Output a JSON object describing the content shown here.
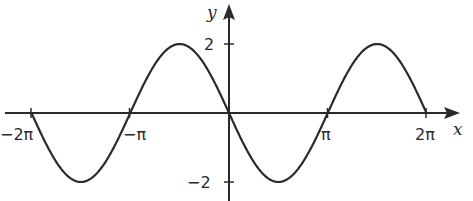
{
  "chart_data": {
    "type": "line",
    "title": "",
    "function": "y = -2 sin(x)",
    "xlabel": "x",
    "ylabel": "y",
    "xlim": [
      -6.2832,
      6.2832
    ],
    "ylim": [
      -2,
      2
    ],
    "grid": false,
    "legend": null,
    "x_ticks": [
      {
        "value": -6.2832,
        "label": "−2π"
      },
      {
        "value": -3.1416,
        "label": "−π"
      },
      {
        "value": 3.1416,
        "label": "π"
      },
      {
        "value": 6.2832,
        "label": "2π"
      }
    ],
    "y_ticks": [
      {
        "value": 2,
        "label": "2"
      },
      {
        "value": -2,
        "label": "−2"
      }
    ],
    "series": [
      {
        "name": "y = -2 sin x",
        "x": [
          -6.2832,
          -5.4978,
          -4.7124,
          -3.927,
          -3.1416,
          -2.3562,
          -1.5708,
          -0.7854,
          0,
          0.7854,
          1.5708,
          2.3562,
          3.1416,
          3.927,
          4.7124,
          5.4978,
          6.2832
        ],
        "y": [
          0,
          -1.414,
          -2,
          -1.414,
          0,
          1.414,
          2,
          1.414,
          0,
          -1.414,
          -2,
          -1.414,
          0,
          1.414,
          2,
          1.414,
          0
        ]
      }
    ]
  },
  "axes": {
    "x_axis_label": "x",
    "y_axis_label": "y",
    "x_tick_labels": [
      "−2π",
      "−π",
      "π",
      "2π"
    ],
    "y_tick_labels": [
      "2",
      "−2"
    ]
  }
}
